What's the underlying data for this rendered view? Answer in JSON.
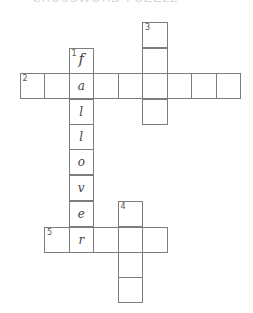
{
  "title_fragment": "CROSSWORD PUZZLE",
  "grid": {
    "cell_size": 24.5,
    "clues": [
      {
        "number": "1",
        "direction": "down",
        "answer": "fallover",
        "filled": [
          "f",
          "a",
          "l",
          "l",
          "o",
          "v",
          "e",
          "r"
        ]
      },
      {
        "number": "2",
        "direction": "across",
        "length": 9,
        "filled": [
          "",
          "",
          "a",
          "",
          "",
          "",
          "",
          "",
          ""
        ]
      },
      {
        "number": "3",
        "direction": "down",
        "length": 4
      },
      {
        "number": "4",
        "direction": "down",
        "length": 4
      },
      {
        "number": "5",
        "direction": "across",
        "length": 5,
        "filled": [
          "",
          "r",
          "",
          "",
          ""
        ]
      }
    ]
  },
  "cells": [
    {
      "id": "c3-1",
      "x": 142,
      "y": 22,
      "num": "3",
      "letter": ""
    },
    {
      "id": "c3-2",
      "x": 142,
      "y": 48,
      "num": "",
      "letter": ""
    },
    {
      "id": "c3-4",
      "x": 142,
      "y": 99,
      "num": "",
      "letter": ""
    },
    {
      "id": "c1-1",
      "x": 68.5,
      "y": 48,
      "num": "1",
      "letter": "f",
      "first": true
    },
    {
      "id": "c1-3",
      "x": 68.5,
      "y": 99,
      "num": "",
      "letter": "l"
    },
    {
      "id": "c1-4",
      "x": 68.5,
      "y": 124,
      "num": "",
      "letter": "l"
    },
    {
      "id": "c1-5",
      "x": 68.5,
      "y": 149,
      "num": "",
      "letter": "o"
    },
    {
      "id": "c1-6",
      "x": 68.5,
      "y": 175,
      "num": "",
      "letter": "v"
    },
    {
      "id": "c1-7",
      "x": 68.5,
      "y": 201,
      "num": "",
      "letter": "e"
    },
    {
      "id": "c2-1",
      "x": 19.5,
      "y": 73,
      "num": "2",
      "letter": ""
    },
    {
      "id": "c2-2",
      "x": 44,
      "y": 73,
      "num": "",
      "letter": ""
    },
    {
      "id": "c2-3",
      "x": 68.5,
      "y": 73,
      "num": "",
      "letter": "a"
    },
    {
      "id": "c2-4",
      "x": 93,
      "y": 73,
      "num": "",
      "letter": ""
    },
    {
      "id": "c2-5",
      "x": 117.5,
      "y": 73,
      "num": "",
      "letter": ""
    },
    {
      "id": "c2-6",
      "x": 142,
      "y": 73,
      "num": "",
      "letter": ""
    },
    {
      "id": "c2-7",
      "x": 166.5,
      "y": 73,
      "num": "",
      "letter": ""
    },
    {
      "id": "c2-8",
      "x": 191,
      "y": 73,
      "num": "",
      "letter": ""
    },
    {
      "id": "c2-9",
      "x": 215.5,
      "y": 73,
      "num": "",
      "letter": ""
    },
    {
      "id": "c4-1",
      "x": 117.5,
      "y": 201,
      "num": "4",
      "letter": ""
    },
    {
      "id": "c4-3",
      "x": 117.5,
      "y": 252,
      "num": "",
      "letter": ""
    },
    {
      "id": "c4-4",
      "x": 117.5,
      "y": 277,
      "num": "",
      "letter": ""
    },
    {
      "id": "c5-1",
      "x": 44,
      "y": 227,
      "num": "5",
      "letter": ""
    },
    {
      "id": "c5-2",
      "x": 68.5,
      "y": 227,
      "num": "",
      "letter": "r"
    },
    {
      "id": "c5-3",
      "x": 93,
      "y": 227,
      "num": "",
      "letter": ""
    },
    {
      "id": "c5-4",
      "x": 117.5,
      "y": 227,
      "num": "",
      "letter": ""
    },
    {
      "id": "c5-5",
      "x": 142,
      "y": 227,
      "num": "",
      "letter": ""
    }
  ]
}
